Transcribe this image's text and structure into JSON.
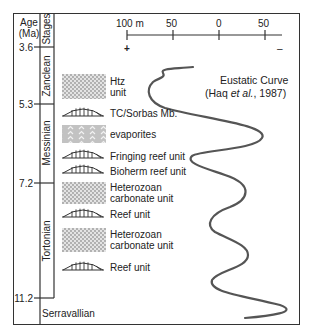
{
  "header": {
    "age_label": "Age\n(Ma)",
    "age_line1": "Age",
    "age_line2": "(Ma)",
    "stages_label": "Stages"
  },
  "ages": [
    {
      "value": "3.6",
      "y": 47
    },
    {
      "value": "5.3",
      "y": 104
    },
    {
      "value": "7.2",
      "y": 183
    },
    {
      "value": "11.2",
      "y": 298
    }
  ],
  "stages": [
    {
      "name": "Zanclean",
      "y_top": 47,
      "y_bottom": 104
    },
    {
      "name": "Messinian",
      "y_top": 104,
      "y_bottom": 183
    },
    {
      "name": "Tortonian",
      "y_top": 183,
      "y_bottom": 298
    },
    {
      "name": "Serravallian",
      "y_top": 298,
      "y_bottom": 325
    }
  ],
  "axis": {
    "ticks": [
      "100 m",
      "50",
      "0",
      "50"
    ],
    "plus": "+",
    "minus": "–"
  },
  "legend_title": {
    "line1": "Eustatic Curve",
    "line2_pre": "(Haq ",
    "line2_italic": "et al.",
    "line2_post": ", 1987)"
  },
  "units": [
    {
      "pattern": "heterozoan",
      "label1": "Htz",
      "label2": "unit",
      "y": 73
    },
    {
      "pattern": "reef",
      "label1": "TC/Sorbas Mb.",
      "label2": "",
      "y": 112
    },
    {
      "pattern": "evaporite",
      "label1": "evaporites",
      "label2": "",
      "y": 130
    },
    {
      "pattern": "reef",
      "label1": "Fringing reef unit",
      "label2": "",
      "y": 154
    },
    {
      "pattern": "reef",
      "label1": "Bioherm reef unit",
      "label2": "",
      "y": 169
    },
    {
      "pattern": "heterozoan",
      "label1": "Heterozoan",
      "label2": "carbonate unit",
      "y": 186
    },
    {
      "pattern": "reef",
      "label1": "Reef unit",
      "label2": "",
      "y": 212
    },
    {
      "pattern": "heterozoan",
      "label1": "Heterozoan",
      "label2": "carbonate unit",
      "y": 230
    },
    {
      "pattern": "reef",
      "label1": "Reef unit",
      "label2": "",
      "y": 265
    }
  ],
  "colors": {
    "line": "#333333",
    "curve": "#555555",
    "evaporite_fill": "#bdbdbd",
    "heterozoan_fill": "#d4d4d4"
  }
}
